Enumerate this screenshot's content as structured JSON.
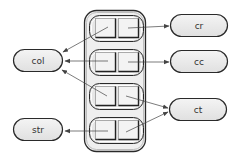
{
  "diagram": {
    "colors": {
      "node_fill": "#e6e6e6",
      "node_stroke": "#2a2a2a",
      "container_fill": "#f0f0f0",
      "row_fill": "#e4e4e4",
      "cell_fill": "#f2f2f2",
      "arrow": "#444444"
    },
    "nodes": {
      "col": "col",
      "cr": "cr",
      "cc": "cc",
      "ct": "ct",
      "str": "str"
    },
    "container": {
      "rows": 4,
      "cells_per_row": 2
    },
    "edges": [
      {
        "from": "row1.cell1",
        "to": "col"
      },
      {
        "from": "row1.cell2",
        "to": "cr"
      },
      {
        "from": "row2.cell1",
        "to": "col"
      },
      {
        "from": "row2.cell2",
        "to": "cc"
      },
      {
        "from": "row3.cell1",
        "to": "col"
      },
      {
        "from": "row3.cell2",
        "to": "ct"
      },
      {
        "from": "row4.cell1",
        "to": "str"
      },
      {
        "from": "row4.cell2",
        "to": "ct"
      }
    ]
  }
}
